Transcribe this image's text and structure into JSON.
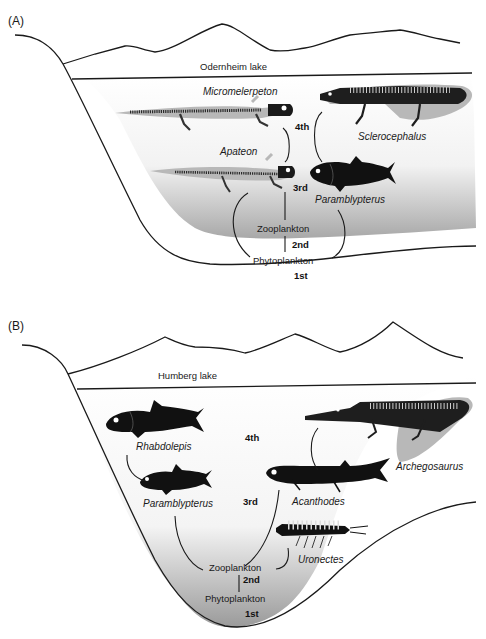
{
  "panels": [
    {
      "id": "A",
      "label": "(A)",
      "lake_name": "Odernheim lake",
      "trophic_levels": {
        "first": "1st",
        "second": "2nd",
        "third": "3rd",
        "fourth": "4th"
      },
      "producers": {
        "phyto": "Phytoplankton",
        "zoo": "Zooplankton"
      },
      "species": {
        "micromelerpeton": "Micromelerpeton",
        "sclerocephalus": "Sclerocephalus",
        "apateon": "Apateon",
        "paramblypterus": "Paramblypterus"
      }
    },
    {
      "id": "B",
      "label": "(B)",
      "lake_name": "Humberg lake",
      "trophic_levels": {
        "first": "1st",
        "second": "2nd",
        "third": "3rd",
        "fourth": "4th"
      },
      "producers": {
        "phyto": "Phytoplankton",
        "zoo": "Zooplankton"
      },
      "species": {
        "rhabdolepis": "Rhabdolepis",
        "paramblypterus": "Paramblypterus",
        "acanthodes": "Acanthodes",
        "archegosaurus": "Archegosaurus",
        "uronectes": "Uronectes"
      }
    }
  ],
  "colors": {
    "ink": "#1a1a1a",
    "skeleton_shadow": "#b4b4b4",
    "water_bottom": "#9a9a9a",
    "water_top": "#ffffff"
  }
}
